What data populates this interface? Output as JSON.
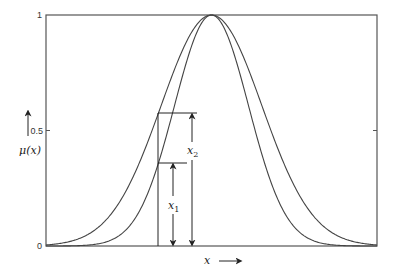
{
  "chart_data": {
    "type": "line",
    "title": "",
    "xlabel": "x",
    "ylabel": "μ(x)",
    "xlim": [
      -1,
      1
    ],
    "ylim": [
      0,
      1
    ],
    "yticks": [
      0,
      0.5,
      1
    ],
    "ytick_labels": [
      "0",
      "0.5",
      "1"
    ],
    "grid": false,
    "legend": null,
    "series": [
      {
        "name": "wide gaussian membership",
        "center": 0,
        "sigma": 0.305
      },
      {
        "name": "narrow gaussian membership",
        "center": 0,
        "sigma": 0.224
      }
    ],
    "annotations": {
      "vertical_line_x": -0.323,
      "x1": {
        "label": "x1",
        "value": 0.36
      },
      "x2": {
        "label": "x2",
        "value": 0.58
      }
    }
  },
  "labels": {
    "ytick_0": "0",
    "ytick_05": "0.5",
    "ytick_1": "1",
    "ylabel": "μ(x)",
    "xlabel": "x",
    "x1_main": "x",
    "x1_sub": "1",
    "x2_main": "x",
    "x2_sub": "2"
  },
  "colors": {
    "axes": "#555555",
    "curve": "#444444",
    "annotation": "#222222"
  }
}
